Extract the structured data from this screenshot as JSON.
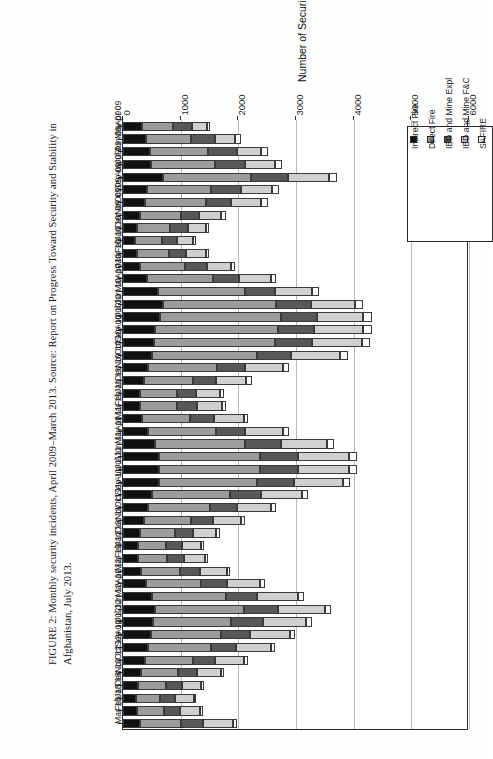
{
  "caption": {
    "line1": "FIGURE 2: Monthly security incidents, April 2009–March 2013. Source: Report on Progress Toward Security and Stability in",
    "line2": "Afghanistan, July 2013."
  },
  "chart_data": {
    "type": "bar",
    "orientation": "horizontal-stacked",
    "title": "",
    "xlabel": "Number of Security Incidents",
    "ylabel": "",
    "xlim": [
      0,
      6000
    ],
    "xticks": [
      0,
      1000,
      2000,
      3000,
      4000,
      5000,
      6000
    ],
    "xtick_labels": [
      "0",
      "1000",
      "2000",
      "3000",
      "4000",
      "5000",
      "6000"
    ],
    "grid": true,
    "legend_position": "top-right",
    "stacked": true,
    "categories": [
      "Apr 09",
      "May 09",
      "Jun 09",
      "Jul 09",
      "Aug 09",
      "Sep 09",
      "Oct 09",
      "Nov 09",
      "Dec 09",
      "Jan 10",
      "Feb 10",
      "Mar 10",
      "Apr 10",
      "May 10",
      "Jun 10",
      "Jul 10",
      "Aug 10",
      "Sep 10",
      "Oct 10",
      "Nov 10",
      "Dec 10",
      "Jan 11",
      "Feb 11",
      "Mar 11",
      "Apr 11",
      "May 11",
      "Jun 11",
      "Jul 11",
      "Aug 11",
      "Sep 11",
      "Oct 11",
      "Nov 11",
      "Dec 11",
      "Jan 12",
      "Feb 12",
      "Mar 12",
      "Apr 12",
      "May 12",
      "Jun 12",
      "Jul 12",
      "Aug 12",
      "Sep 12",
      "Oct 12",
      "Nov 12",
      "Dec 12",
      "Jan 13",
      "Feb 13",
      "Mar 13"
    ],
    "series": [
      {
        "name": "Indirect Fire",
        "color": "#101010",
        "values": [
          330,
          400,
          470,
          480,
          700,
          410,
          380,
          300,
          250,
          200,
          240,
          290,
          420,
          600,
          700,
          640,
          560,
          540,
          500,
          430,
          360,
          300,
          300,
          330,
          430,
          560,
          620,
          620,
          620,
          500,
          430,
          360,
          300,
          260,
          260,
          320,
          400,
          500,
          560,
          520,
          480,
          440,
          380,
          320,
          260,
          230,
          250,
          300
        ]
      },
      {
        "name": "Direct Fire",
        "color": "#9c9c9c",
        "values": [
          530,
          780,
          1000,
          1120,
          1520,
          1110,
          1060,
          700,
          570,
          480,
          560,
          780,
          1140,
          1520,
          1960,
          2100,
          2120,
          2100,
          1820,
          1200,
          860,
          640,
          640,
          840,
          1180,
          1560,
          1760,
          1760,
          1700,
          1360,
          1080,
          820,
          600,
          480,
          500,
          660,
          960,
          1280,
          1540,
          1360,
          1220,
          1080,
          840,
          640,
          480,
          420,
          460,
          700
        ]
      },
      {
        "name": "IED and Mine Expl",
        "color": "#585858",
        "values": [
          330,
          420,
          500,
          520,
          640,
          520,
          440,
          320,
          300,
          260,
          300,
          380,
          460,
          520,
          600,
          620,
          640,
          640,
          600,
          480,
          400,
          320,
          340,
          400,
          500,
          620,
          660,
          660,
          640,
          540,
          460,
          380,
          320,
          280,
          300,
          360,
          440,
          540,
          580,
          540,
          500,
          440,
          380,
          320,
          280,
          260,
          280,
          380
        ]
      },
      {
        "name": "IED and Mine F&C",
        "color": "#d0d0d0",
        "values": [
          260,
          340,
          430,
          520,
          720,
          540,
          520,
          380,
          320,
          280,
          340,
          420,
          540,
          640,
          760,
          800,
          840,
          860,
          840,
          660,
          520,
          420,
          440,
          520,
          660,
          800,
          880,
          880,
          860,
          700,
          600,
          480,
          400,
          340,
          360,
          460,
          580,
          720,
          820,
          760,
          700,
          600,
          500,
          420,
          340,
          320,
          340,
          520
        ]
      },
      {
        "name": "SAFIRE",
        "color": "#ffffff",
        "values": [
          60,
          100,
          110,
          120,
          130,
          120,
          110,
          80,
          60,
          50,
          60,
          80,
          100,
          120,
          140,
          150,
          150,
          150,
          140,
          110,
          90,
          70,
          70,
          80,
          100,
          120,
          130,
          130,
          120,
          100,
          90,
          70,
          60,
          50,
          50,
          60,
          80,
          100,
          110,
          100,
          90,
          80,
          70,
          60,
          50,
          40,
          50,
          70
        ]
      }
    ]
  }
}
